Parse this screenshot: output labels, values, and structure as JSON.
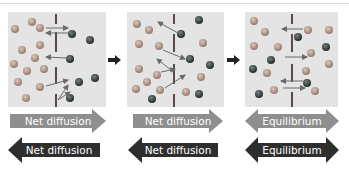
{
  "figure": {
    "panels": [
      {
        "name": "panel-1"
      },
      {
        "name": "panel-2"
      },
      {
        "name": "panel-3"
      }
    ],
    "labels": {
      "row1": [
        "Net diffusion",
        "Net diffusion",
        "Equilibrium"
      ],
      "row2": [
        "Net diffusion",
        "Net diffusion",
        "Equilibrium"
      ]
    },
    "colors": {
      "panel_bg": "#e4e4e4",
      "light_particle": "#b59a8c",
      "dark_particle": "#404848",
      "membrane": "#6a5a5a",
      "arrow_light": "#8a8a8a",
      "arrow_dark": "#333333"
    }
  }
}
